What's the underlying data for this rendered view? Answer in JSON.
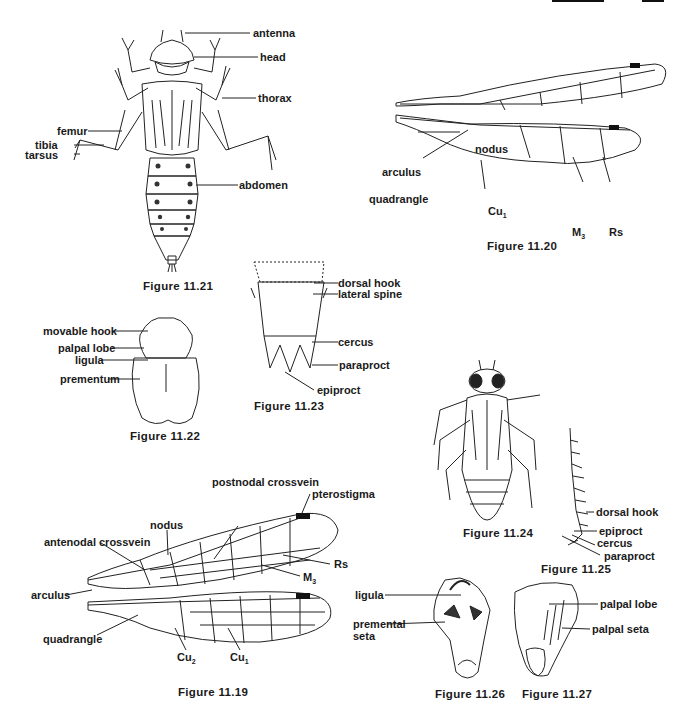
{
  "page": {
    "header_partial": true
  },
  "figures": {
    "fig_11_21": {
      "caption": "Figure 11.21",
      "labels": [
        "antenna",
        "head",
        "thorax",
        "femur",
        "tibia",
        "tarsus",
        "abdomen"
      ]
    },
    "fig_11_20": {
      "caption": "Figure 11.20",
      "labels": [
        "nodus",
        "arculus",
        "quadrangle",
        "Cu",
        "M",
        "Rs"
      ],
      "subscripts": {
        "Cu": "1",
        "M": "3"
      }
    },
    "fig_11_22": {
      "caption": "Figure 11.22",
      "labels": [
        "movable hook",
        "palpal lobe",
        "ligula",
        "prementum"
      ]
    },
    "fig_11_23": {
      "caption": "Figure 11.23",
      "labels": [
        "dorsal hook",
        "lateral spine",
        "cercus",
        "paraproct",
        "epiproct"
      ]
    },
    "fig_11_24": {
      "caption": "Figure 11.24"
    },
    "fig_11_25": {
      "caption": "Figure 11.25",
      "labels": [
        "dorsal hook",
        "epiproct",
        "cercus",
        "paraproct"
      ]
    },
    "fig_11_19": {
      "caption": "Figure 11.19",
      "labels": [
        "postnodal crossvein",
        "pterostigma",
        "nodus",
        "antenodal crossvein",
        "Rs",
        "M",
        "arculus",
        "quadrangle",
        "Cu",
        "Cu"
      ],
      "subscripts": {
        "M": "3",
        "Cu_a": "2",
        "Cu_b": "1"
      }
    },
    "fig_11_26": {
      "caption": "Figure 11.26",
      "labels": [
        "ligula",
        "premental",
        "seta"
      ]
    },
    "fig_11_27": {
      "caption": "Figure 11.27",
      "labels": [
        "palpal lobe",
        "palpal seta"
      ]
    }
  }
}
